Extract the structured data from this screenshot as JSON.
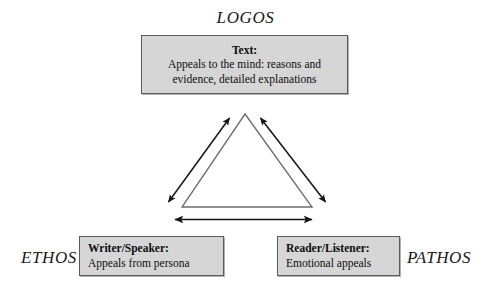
{
  "diagram": {
    "corner_labels": {
      "top": "LOGOS",
      "left": "ETHOS",
      "right": "PATHOS"
    },
    "boxes": {
      "text": {
        "title": "Text:",
        "line1": "Appeals to the mind: reasons and",
        "line2": "evidence, detailed explanations"
      },
      "writer": {
        "title": "Writer/Speaker:",
        "line1": "Appeals from persona"
      },
      "reader": {
        "title": "Reader/Listener:",
        "line1": "Emotional appeals"
      }
    },
    "colors": {
      "box_fill": "#d6d6d6",
      "box_border": "#5a5a5a",
      "triangle_stroke": "#6e6e6e",
      "arrow_stroke": "#151515",
      "background": "#ffffff",
      "text": "#0d0d0d"
    },
    "geometry": {
      "apex": [
        245,
        114
      ],
      "bottom_left": [
        182,
        207
      ],
      "bottom_right": [
        312,
        207
      ]
    }
  }
}
